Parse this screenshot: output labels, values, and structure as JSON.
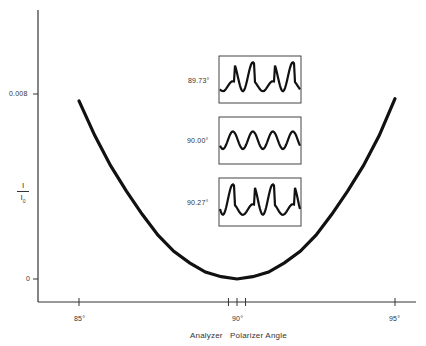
{
  "chart_data": {
    "type": "line",
    "title": "",
    "xlabel": "Analyzer   Polarizer Angle",
    "ylabel": "I / I0",
    "ylabel_numerator": "I",
    "ylabel_denominator": "I",
    "ylabel_sub": "0",
    "xlim": [
      84.3,
      95.7
    ],
    "ylim": [
      -0.001,
      0.0117
    ],
    "x_ticks": [
      "85°",
      "90°",
      "95°"
    ],
    "x_tick_values": [
      85,
      90,
      95
    ],
    "x_minor_tick_values": [
      89.73,
      90.27
    ],
    "y_ticks": [
      "0",
      "0.008"
    ],
    "y_tick_values": [
      0,
      0.008
    ],
    "grid": false,
    "legend": null,
    "series": [
      {
        "name": "I/I0 vs angle",
        "x": [
          85,
          85.5,
          86,
          86.5,
          87,
          87.5,
          88,
          88.5,
          89,
          89.5,
          90,
          90.5,
          91,
          91.5,
          92,
          92.5,
          93,
          93.5,
          94,
          94.5,
          95
        ],
        "y": [
          0.0077,
          0.0062,
          0.0049,
          0.0038,
          0.0028,
          0.0019,
          0.0012,
          0.0007,
          0.0003,
          0.0001,
          0.0,
          0.0001,
          0.0003,
          0.0007,
          0.0012,
          0.0019,
          0.0028,
          0.0038,
          0.0049,
          0.0062,
          0.0078
        ]
      }
    ],
    "insets": [
      {
        "label": "89.73°",
        "description": "waveform with alternating large and small peaks (small, large, small, large)"
      },
      {
        "label": "90.00°",
        "description": "uniform sinusoid, four equal peaks"
      },
      {
        "label": "90.27°",
        "description": "waveform with alternating large and small peaks (large, small, large, small)"
      }
    ]
  }
}
